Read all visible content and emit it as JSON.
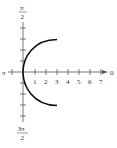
{
  "diagram": {
    "type": "polar-graph",
    "axis_labels": {
      "left": "π",
      "right": "0",
      "top_num": "π",
      "top_den": "2",
      "bottom_num": "3π",
      "bottom_den": "2"
    },
    "tick_labels": [
      "1",
      "2",
      "3",
      "4",
      "5",
      "6",
      "7"
    ],
    "curve": "arc from (3, π/2-ish) through origin to (3, 3π/2-ish)"
  }
}
